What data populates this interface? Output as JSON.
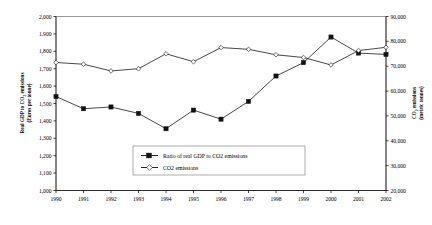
{
  "chart_data": {
    "type": "line",
    "title": "",
    "xlabel": "",
    "grid": false,
    "legend_position": "inside-center-lower",
    "categories": [
      "1990",
      "1991",
      "1992",
      "1993",
      "1994",
      "1995",
      "1996",
      "1997",
      "1998",
      "1999",
      "2000",
      "2001",
      "2002"
    ],
    "x": [
      1990,
      1991,
      1992,
      1993,
      1994,
      1995,
      1996,
      1997,
      1998,
      1999,
      2000,
      2001,
      2002
    ],
    "axes": {
      "left": {
        "label_line1": "Real GDP to CO",
        "label_sub": "2",
        "label_line1b": " emissions",
        "label_line2": "(Euros per tonne)",
        "full_label": "Real GDP to CO2 emissions (Euros per tonne)",
        "min": 1000,
        "max": 2000,
        "step": 100,
        "ticks": [
          "1,000",
          "1,100",
          "1,200",
          "1,300",
          "1,400",
          "1,500",
          "1,600",
          "1,700",
          "1,800",
          "1,900",
          "2,000"
        ],
        "tick_values": [
          1000,
          1100,
          1200,
          1300,
          1400,
          1500,
          1600,
          1700,
          1800,
          1900,
          2000
        ]
      },
      "right": {
        "label_line1": "CO",
        "label_sub": "2",
        "label_line1b": " emissions",
        "label_line2": "(metric tonnes)",
        "full_label": "CO2 emissions (metric tonnes)",
        "min": 20000,
        "max": 90000,
        "step": 10000,
        "ticks": [
          "20,000",
          "30,000",
          "40,000",
          "50,000",
          "60,000",
          "70,000",
          "80,000",
          "90,000"
        ],
        "tick_values": [
          20000,
          30000,
          40000,
          50000,
          60000,
          70000,
          80000,
          90000
        ]
      }
    },
    "series": [
      {
        "name": "Ratio of real GDP to CO2 emissions",
        "axis": "left",
        "marker": "filled-square",
        "values": [
          1540,
          1470,
          1480,
          1443,
          1355,
          1462,
          1410,
          1512,
          1658,
          1735,
          1882,
          1790,
          1782
        ]
      },
      {
        "name": "CO2 emissions",
        "axis": "right",
        "marker": "open-diamond",
        "values": [
          71500,
          70800,
          68100,
          69000,
          75000,
          71800,
          77500,
          76800,
          74600,
          73500,
          70500,
          76300,
          77600
        ]
      }
    ],
    "legend": [
      {
        "label": "Ratio of real GDP to CO2 emissions",
        "marker": "filled-square"
      },
      {
        "label": "CO2 emissions",
        "marker": "open-diamond"
      }
    ]
  }
}
